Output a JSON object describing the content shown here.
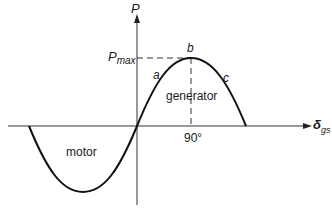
{
  "diagram": {
    "y_axis_label": "P",
    "x_axis_label_main": "δ",
    "x_axis_label_sub": "gs",
    "pmax_label_main": "P",
    "pmax_label_sub": "max",
    "point_labels": {
      "a": "a",
      "b": "b",
      "c": "c"
    },
    "region_labels": {
      "generator": "generator",
      "motor": "motor"
    },
    "tick_label_90": "90°",
    "colors": {
      "line": "#111111",
      "axis": "#333333",
      "dashed": "#333333"
    }
  }
}
